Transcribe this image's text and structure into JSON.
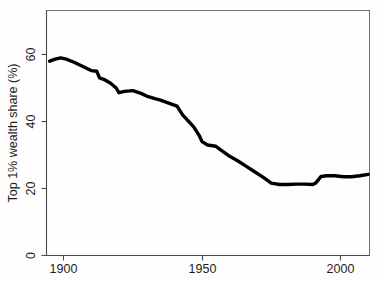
{
  "chart_data": {
    "type": "line",
    "title": "",
    "subtitle": "",
    "xlabel": "",
    "ylabel": "Top 1% wealth share (%)",
    "xlim": [
      1893,
      2012
    ],
    "ylim": [
      0,
      73
    ],
    "xticks": [
      1900,
      1950,
      2000
    ],
    "xticklabels": [
      "1900",
      "1950",
      "2000"
    ],
    "yticks": [
      0,
      20,
      40,
      60
    ],
    "yticklabels": [
      "0",
      "20",
      "40",
      "60"
    ],
    "grid": false,
    "legend": null,
    "legend_position": "none",
    "annotations": [],
    "series": [
      {
        "name": "Top 1% wealth share",
        "color": "#000000",
        "x": [
          1895,
          1897,
          1899,
          1901,
          1904,
          1907,
          1910,
          1912,
          1913,
          1915,
          1917,
          1919,
          1920,
          1922,
          1925,
          1928,
          1930,
          1933,
          1935,
          1937,
          1939,
          1941,
          1943,
          1945,
          1947,
          1949,
          1950,
          1952,
          1955,
          1957,
          1960,
          1963,
          1966,
          1969,
          1972,
          1975,
          1978,
          1981,
          1984,
          1987,
          1990,
          1991,
          1993,
          1995,
          1998,
          2001,
          2004,
          2007,
          2010
        ],
        "y": [
          58.0,
          58.6,
          59.0,
          58.6,
          57.6,
          56.4,
          55.2,
          55.0,
          53.0,
          52.4,
          51.4,
          50.0,
          48.6,
          49.0,
          49.2,
          48.4,
          47.6,
          46.8,
          46.4,
          45.8,
          45.2,
          44.6,
          42.0,
          40.2,
          38.4,
          35.8,
          34.0,
          33.0,
          32.6,
          31.4,
          29.6,
          28.2,
          26.6,
          25.0,
          23.4,
          21.6,
          21.2,
          21.2,
          21.3,
          21.3,
          21.2,
          21.6,
          23.6,
          23.8,
          23.8,
          23.5,
          23.5,
          23.8,
          24.2
        ]
      }
    ]
  },
  "axes": {
    "y_axis_label": "Top 1% wealth share (%)",
    "y_tick_labels": [
      "60",
      "40",
      "20",
      "0"
    ],
    "x_tick_labels": [
      "1900",
      "1950",
      "2000"
    ]
  }
}
